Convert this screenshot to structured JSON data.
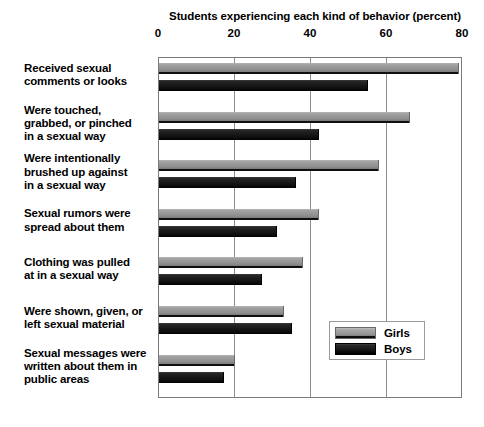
{
  "chart_data": {
    "type": "bar",
    "orientation": "horizontal",
    "title": "Students experiencing each kind of behavior (percent)",
    "xlabel": "",
    "ylabel": "",
    "xlim": [
      0,
      80
    ],
    "xticks": [
      0,
      20,
      40,
      60,
      80
    ],
    "xtick_labels": [
      "0",
      "20",
      "40",
      "60",
      "80"
    ],
    "grid": true,
    "legend_position": "center-right",
    "categories": [
      "Received sexual comments or looks",
      "Were touched, grabbed, or pinched in a sexual way",
      "Were intentionally brushed up against in a sexual way",
      "Sexual rumors were spread about them",
      "Clothing was pulled at in a sexual way",
      "Were shown, given, or left sexual material",
      "Sexual messages were written about them in public areas"
    ],
    "category_lines": [
      [
        "Received sexual",
        "comments or looks"
      ],
      [
        "Were touched,",
        "grabbed, or pinched",
        "in a sexual way"
      ],
      [
        "Were intentionally",
        "brushed up against",
        "in a sexual way"
      ],
      [
        "Sexual rumors were",
        "spread about them"
      ],
      [
        "Clothing was pulled",
        "at in a sexual way"
      ],
      [
        "Were shown, given, or",
        "left sexual material"
      ],
      [
        "Sexual messages were",
        "written about them in",
        "public areas"
      ]
    ],
    "series": [
      {
        "name": "Girls",
        "color": "#8f8f8f",
        "values": [
          79,
          66,
          58,
          42,
          38,
          33,
          20
        ]
      },
      {
        "name": "Boys",
        "color": "#141414",
        "values": [
          55,
          42,
          36,
          31,
          27,
          35,
          17
        ]
      }
    ]
  },
  "legend": {
    "items": [
      {
        "label": "Girls",
        "swatch": "girls"
      },
      {
        "label": "Boys",
        "swatch": "boys"
      }
    ]
  }
}
